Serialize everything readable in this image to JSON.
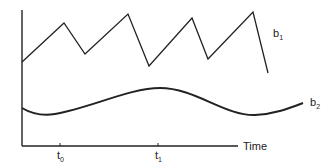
{
  "chart_data": {
    "type": "line",
    "title": "",
    "xlabel": "Time",
    "ylabel": "",
    "x_ticks": [
      {
        "label": "t",
        "sub": "0",
        "x": 60
      },
      {
        "label": "t",
        "sub": "1",
        "x": 158
      }
    ],
    "series": [
      {
        "name": "b1",
        "label": "b",
        "label_sub": "1",
        "style": "sawtooth",
        "points": [
          [
            22,
            62
          ],
          [
            64,
            23
          ],
          [
            85,
            54
          ],
          [
            128,
            14
          ],
          [
            149,
            66
          ],
          [
            192,
            18
          ],
          [
            208,
            59
          ],
          [
            253,
            12
          ],
          [
            268,
            73
          ]
        ]
      },
      {
        "name": "b2",
        "label": "b",
        "label_sub": "2",
        "style": "smooth wave",
        "path": "M22,108 C32,114 42,116 55,114 C90,108 130,88 160,88 C195,88 225,116 255,115 C275,114 290,108 303,103"
      }
    ],
    "grid": false,
    "legend": "inline labels"
  },
  "labels": {
    "x_axis": "Time",
    "t0": {
      "main": "t",
      "sub": "0"
    },
    "t1": {
      "main": "t",
      "sub": "1"
    },
    "b1": {
      "main": "b",
      "sub": "1"
    },
    "b2": {
      "main": "b",
      "sub": "2"
    }
  }
}
